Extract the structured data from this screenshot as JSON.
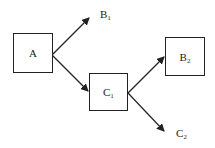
{
  "diagram": {
    "nodes": [
      {
        "id": "A",
        "label": "A"
      },
      {
        "id": "C1",
        "label": "C₁"
      },
      {
        "id": "B2",
        "label": "B₂"
      }
    ],
    "labels": [
      {
        "id": "B1",
        "label": "B₁"
      },
      {
        "id": "C2",
        "label": "C₂"
      }
    ],
    "edges": [
      {
        "from": "A",
        "to": "B1"
      },
      {
        "from": "A",
        "to": "C1"
      },
      {
        "from": "C1",
        "to": "B2"
      },
      {
        "from": "C1",
        "to": "C2"
      }
    ],
    "color": "#222222"
  }
}
